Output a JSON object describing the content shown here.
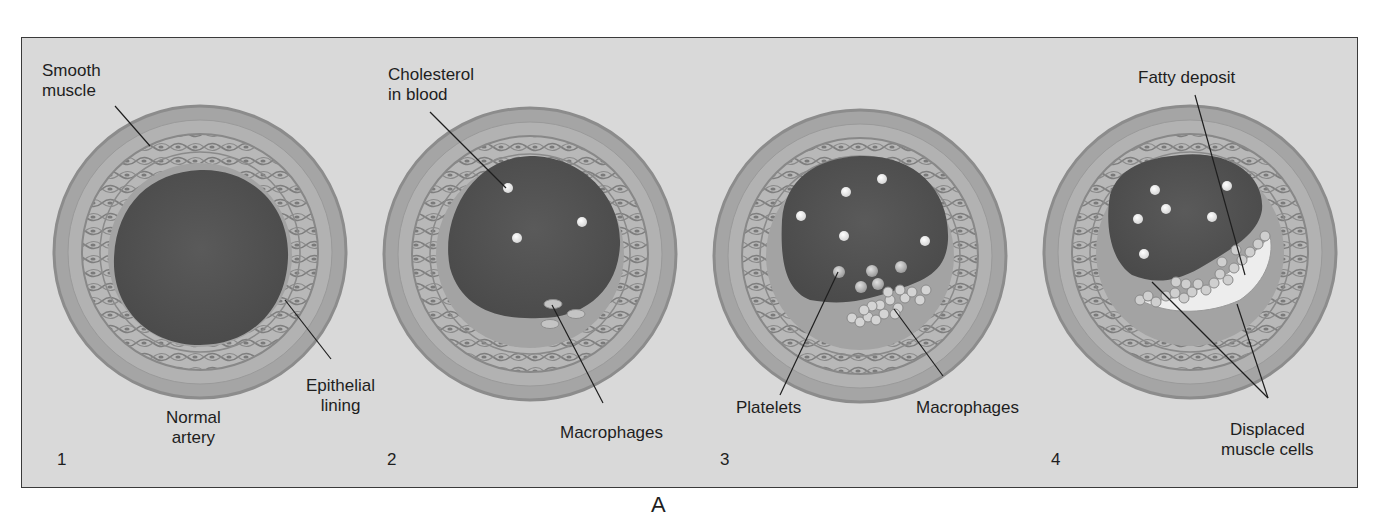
{
  "figure": {
    "letter": "A",
    "background_color": "#d9d9d9",
    "border_color": "#3a3a3a",
    "colors": {
      "outer_wall": "#a9a9a9",
      "outer_wall_edge": "#8a8a8a",
      "muscle_layer": "#b6b6b6",
      "muscle_strands": "#7e7e7e",
      "epithelium": "#a0a0a0",
      "lumen": "#545454",
      "cholesterol": "#f2f2f2",
      "macrophage": "#c8c8c8",
      "fatty_deposit": "#ededed"
    },
    "panels": [
      {
        "number": "1",
        "caption": [
          "Normal",
          "artery"
        ],
        "labels": [
          {
            "id": "smooth-muscle",
            "lines": [
              "Smooth",
              "muscle"
            ]
          },
          {
            "id": "epithelial-lining",
            "lines": [
              "Epithelial",
              "lining"
            ]
          }
        ]
      },
      {
        "number": "2",
        "labels": [
          {
            "id": "cholesterol-in-blood",
            "lines": [
              "Cholesterol",
              "in blood"
            ]
          },
          {
            "id": "macrophages",
            "lines": [
              "Macrophages"
            ]
          }
        ]
      },
      {
        "number": "3",
        "labels": [
          {
            "id": "platelets",
            "lines": [
              "Platelets"
            ]
          },
          {
            "id": "macrophages",
            "lines": [
              "Macrophages"
            ]
          }
        ]
      },
      {
        "number": "4",
        "labels": [
          {
            "id": "fatty-deposit",
            "lines": [
              "Fatty deposit"
            ]
          },
          {
            "id": "displaced-muscle-cells",
            "lines": [
              "Displaced",
              "muscle cells"
            ]
          }
        ]
      }
    ]
  }
}
